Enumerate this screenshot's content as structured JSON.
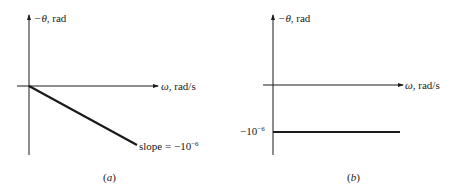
{
  "panels": [
    {
      "id": "a",
      "caption": "(a)",
      "caption_letter": "a",
      "y_axis_label": {
        "symbol": "−θ",
        "unit": ", rad"
      },
      "x_axis_label": {
        "symbol": "ω",
        "unit": ", rad/s"
      },
      "annotation": {
        "text": "slope = −10",
        "exponent": "−6"
      },
      "line": {
        "type": "sloped",
        "from": [
          0,
          0
        ],
        "slope": "-1e-6"
      }
    },
    {
      "id": "b",
      "caption": "(b)",
      "caption_letter": "b",
      "y_axis_label": {
        "symbol": "−θ",
        "unit": ", rad"
      },
      "x_axis_label": {
        "symbol": "ω",
        "unit": ", rad/s"
      },
      "annotation": {
        "text": "−10",
        "exponent": "−6"
      },
      "line": {
        "type": "horizontal",
        "y_value": "-1e-6"
      }
    }
  ],
  "colors": {
    "ink": "#1a1a1a",
    "background": "#ffffff"
  }
}
